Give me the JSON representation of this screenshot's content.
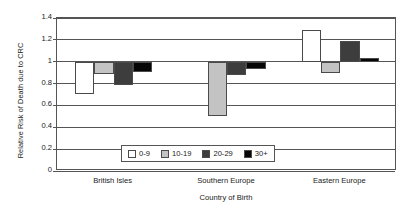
{
  "chart_data": {
    "type": "bar",
    "title": "",
    "xlabel": "Country of Birth",
    "ylabel": "Relative Risk of Death due to CRC",
    "categories": [
      "British Isles",
      "Southern Europe",
      "Eastern Europe"
    ],
    "series": [
      {
        "name": "0-9",
        "color": "#ffffff",
        "values": [
          0.7,
          1.0,
          1.29
        ]
      },
      {
        "name": "10-19",
        "color": "#c3c3c3",
        "values": [
          0.89,
          0.5,
          0.9
        ]
      },
      {
        "name": "20-29",
        "color": "#3d3d3d",
        "values": [
          0.79,
          0.88,
          1.19
        ]
      },
      {
        "name": "30+",
        "color": "#060606",
        "values": [
          0.91,
          0.93,
          1.03
        ]
      }
    ],
    "baseline": 1.0,
    "ylim": [
      0,
      1.4
    ],
    "yticks": [
      0,
      0.2,
      0.4,
      0.6,
      0.8,
      1,
      1.2,
      1.4
    ],
    "yticklabels": [
      "0",
      "0.2",
      "0.4",
      "0.6",
      "0.8",
      "1",
      "1.2",
      "1.4"
    ],
    "grid": true,
    "legend_position": "inside-bottom-center",
    "legend_entries": [
      "0-9",
      "10-19",
      "20-29",
      "30+"
    ]
  }
}
